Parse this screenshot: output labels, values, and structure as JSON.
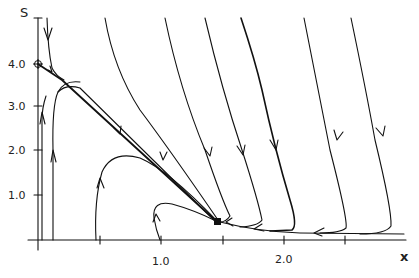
{
  "diagram": {
    "type": "phase-portrait",
    "axes": {
      "x_label": "x",
      "y_label": "S",
      "x_ticks": [
        {
          "value": "1.0"
        },
        {
          "value": "2.0"
        }
      ],
      "y_ticks": [
        {
          "value": "1.0"
        },
        {
          "value": "2.0"
        },
        {
          "value": "3.0"
        },
        {
          "value": "4.0"
        }
      ]
    },
    "markers": {
      "equilibrium_stable": "filled-square",
      "equilibrium_saddle": "circle-cross"
    },
    "colors": {
      "ink": "#111111",
      "background": "#ffffff"
    }
  }
}
